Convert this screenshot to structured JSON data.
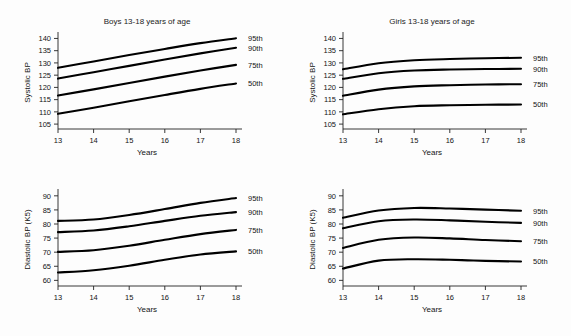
{
  "figure": {
    "name": "blood-pressure-percentile-charts",
    "background_color": "#fdfdfd",
    "curve_color": "#000000",
    "axis_color": "#222222"
  },
  "panels": [
    {
      "id": "boys-systolic",
      "title": "Boys 13-18 years of age",
      "ylabel": "Systolic BP",
      "xlabel": "Years"
    },
    {
      "id": "girls-systolic",
      "title": "Girls 13-18 years of age",
      "ylabel": "Systolic BP",
      "xlabel": "Years"
    },
    {
      "id": "boys-diastolic",
      "title": "",
      "ylabel": "Diastolic BP (K5)",
      "xlabel": "Years"
    },
    {
      "id": "girls-diastolic",
      "title": "",
      "ylabel": "Diastolic BP (K5)",
      "xlabel": "Years"
    }
  ],
  "legend_labels": [
    "95th",
    "90th",
    "75th",
    "50th"
  ],
  "chart_data": [
    {
      "type": "line",
      "id": "boys-systolic",
      "title": "Boys 13-18 years of age",
      "xlabel": "Years",
      "ylabel": "Systolic BP",
      "xlim": [
        13,
        18
      ],
      "ylim": [
        103,
        141
      ],
      "xticks": [
        13,
        14,
        15,
        16,
        17,
        18
      ],
      "yticks": [
        105,
        110,
        115,
        120,
        125,
        130,
        135,
        140
      ],
      "grid": false,
      "legend_position": "right-outside",
      "x": [
        13,
        14,
        15,
        16,
        17,
        18
      ],
      "series": [
        {
          "name": "95th",
          "values": [
            128.0,
            130.6,
            133.2,
            135.7,
            138.1,
            140.1
          ]
        },
        {
          "name": "90th",
          "values": [
            123.6,
            126.2,
            128.8,
            131.4,
            133.9,
            136.2
          ]
        },
        {
          "name": "75th",
          "values": [
            116.7,
            119.2,
            121.8,
            124.4,
            126.9,
            129.2
          ]
        },
        {
          "name": "50th",
          "values": [
            109.2,
            111.7,
            114.3,
            116.9,
            119.4,
            121.6
          ]
        }
      ]
    },
    {
      "type": "line",
      "id": "girls-systolic",
      "title": "Girls 13-18 years of age",
      "xlabel": "Years",
      "ylabel": "Systolic BP",
      "xlim": [
        13,
        18
      ],
      "ylim": [
        103,
        141
      ],
      "xticks": [
        13,
        14,
        15,
        16,
        17,
        18
      ],
      "yticks": [
        105,
        110,
        115,
        120,
        125,
        130,
        135,
        140
      ],
      "grid": false,
      "legend_position": "right-outside",
      "x": [
        13,
        14,
        15,
        16,
        17,
        18
      ],
      "series": [
        {
          "name": "95th",
          "values": [
            127.4,
            129.9,
            131.1,
            131.6,
            131.9,
            132.1
          ]
        },
        {
          "name": "90th",
          "values": [
            123.5,
            125.8,
            126.9,
            127.3,
            127.5,
            127.6
          ]
        },
        {
          "name": "75th",
          "values": [
            116.6,
            119.1,
            120.4,
            120.9,
            121.2,
            121.3
          ]
        },
        {
          "name": "50th",
          "values": [
            109.0,
            111.1,
            112.3,
            112.7,
            112.9,
            113.0
          ]
        }
      ]
    },
    {
      "type": "line",
      "id": "boys-diastolic",
      "title": "",
      "xlabel": "Years",
      "ylabel": "Diastolic BP (K5)",
      "xlim": [
        13,
        18
      ],
      "ylim": [
        58,
        91
      ],
      "xticks": [
        13,
        14,
        15,
        16,
        17,
        18
      ],
      "yticks": [
        60,
        65,
        70,
        75,
        80,
        85,
        90
      ],
      "grid": false,
      "legend_position": "right-outside",
      "x": [
        13,
        14,
        15,
        16,
        17,
        18
      ],
      "series": [
        {
          "name": "95th",
          "values": [
            81.1,
            81.6,
            83.2,
            85.3,
            87.5,
            89.2
          ]
        },
        {
          "name": "90th",
          "values": [
            77.1,
            77.7,
            79.2,
            81.1,
            82.9,
            84.2
          ]
        },
        {
          "name": "75th",
          "values": [
            70.1,
            70.7,
            72.3,
            74.4,
            76.4,
            77.9
          ]
        },
        {
          "name": "50th",
          "values": [
            62.8,
            63.6,
            65.2,
            67.3,
            69.2,
            70.3
          ]
        }
      ]
    },
    {
      "type": "line",
      "id": "girls-diastolic",
      "title": "",
      "xlabel": "Years",
      "ylabel": "Diastolic BP (K5)",
      "xlim": [
        13,
        18
      ],
      "ylim": [
        58,
        91
      ],
      "xticks": [
        13,
        14,
        15,
        16,
        17,
        18
      ],
      "yticks": [
        60,
        65,
        70,
        75,
        80,
        85,
        90
      ],
      "grid": false,
      "legend_position": "right-outside",
      "x": [
        13,
        14,
        15,
        16,
        17,
        18
      ],
      "series": [
        {
          "name": "95th",
          "values": [
            82.2,
            84.8,
            85.7,
            85.5,
            85.1,
            84.7
          ]
        },
        {
          "name": "90th",
          "values": [
            78.5,
            81.0,
            81.6,
            81.3,
            80.8,
            80.4
          ]
        },
        {
          "name": "75th",
          "values": [
            71.5,
            74.4,
            75.2,
            74.9,
            74.3,
            73.9
          ]
        },
        {
          "name": "50th",
          "values": [
            64.2,
            67.0,
            67.5,
            67.3,
            66.9,
            66.7
          ]
        }
      ]
    }
  ]
}
